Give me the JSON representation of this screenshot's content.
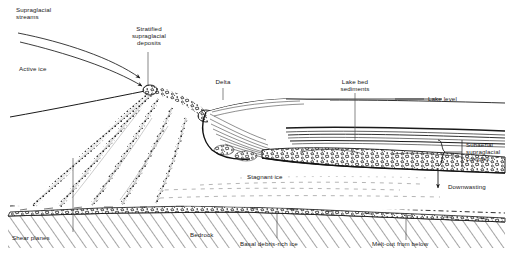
{
  "figure": {
    "colors": {
      "ink": "#1a1a1a",
      "background": "#ffffff",
      "leader": "#555555",
      "debris": "#111111"
    }
  },
  "labels": {
    "supraglacial_streams": "Supraglacial\nstreams",
    "stratified_supraglacial_deposits": "Stratified\nsupraglacial\ndeposits",
    "active_ice": "Active ice",
    "delta": "Delta",
    "lake_bed_sediments": "Lake bed\nsediments",
    "lake_level": "Lake level",
    "subaerial_supraglacial_complex": "Subaerial\nsupraglacial\ncomplex",
    "downwasting": "Downwasting",
    "stagnant_ice": "Stagnant ice",
    "shear_planes": "Shear planes",
    "bedrock": "Bedrock",
    "basal_debris_rich_ice": "Basal debris-rich ice",
    "melt_out_from_below": "Melt-out from below"
  },
  "annotations": {
    "stream_arrows": "flow-arrows-pointing-downglacier",
    "brace": "curly-brace-right",
    "downwasting_arrow": "arrow-down",
    "bedrock_hatch": "diagonal-hatching"
  }
}
